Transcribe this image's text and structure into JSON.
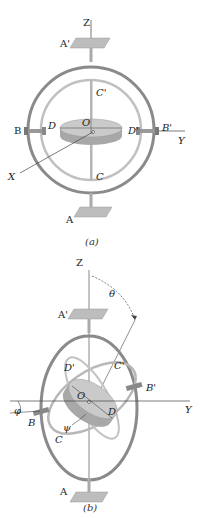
{
  "figure_a": {
    "caption": "(a)",
    "labels": {
      "Z": "Z",
      "A_prime": "A'",
      "C_prime": "C'",
      "B": "B",
      "D": "D",
      "O": "O",
      "D_prime": "D'",
      "B_prime": "B'",
      "Y": "Y",
      "X": "X",
      "C": "C",
      "A": "A"
    }
  },
  "figure_b": {
    "caption": "(b)",
    "labels": {
      "Z": "Z",
      "theta": "θ",
      "A_prime": "A'",
      "D_prime": "D'",
      "C_prime": "C'",
      "B_prime": "B'",
      "O": "O",
      "phi": "φ",
      "B": "B",
      "D": "D",
      "Y": "Y",
      "psi": "ψ",
      "C": "C",
      "A": "A"
    }
  },
  "colors": {
    "outer_ring": "#8a8a8a",
    "inner_ring": "#b9b9b9",
    "disk_top": "#c9c9c9",
    "disk_side": "#a8a8a8",
    "plate": "#bdbdbd",
    "line": "#333333"
  }
}
